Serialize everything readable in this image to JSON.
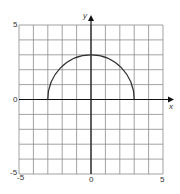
{
  "chart_data": {
    "type": "line",
    "title": "",
    "xlabel": "x",
    "ylabel": "y",
    "xlim": [
      -5,
      5
    ],
    "ylim": [
      -5,
      5
    ],
    "grid": true,
    "grid_step": 1,
    "tick_labels": {
      "x": [
        "-5",
        "0",
        "5"
      ],
      "y": [
        "-5",
        "0",
        "5"
      ]
    },
    "series": [
      {
        "name": "semicircle y = sqrt(9 - x^2)",
        "shape": "upper semicircle",
        "center": [
          0,
          0
        ],
        "radius": 3,
        "x": [
          -3,
          -2.5,
          -2,
          -1.5,
          -1,
          -0.5,
          0,
          0.5,
          1,
          1.5,
          2,
          2.5,
          3
        ],
        "y": [
          0,
          1.66,
          2.24,
          2.6,
          2.83,
          2.96,
          3,
          2.96,
          2.83,
          2.6,
          2.24,
          1.66,
          0
        ]
      }
    ],
    "legend": null
  },
  "labels": {
    "x_axis": "x",
    "y_axis": "y",
    "y_top": "5",
    "y_zero": "0",
    "y_bottom": "-5",
    "x_left": "-5",
    "x_zero": "0",
    "x_right": "5"
  },
  "colors": {
    "grid": "#8c8c8c",
    "axis": "#111111",
    "curve": "#333333"
  }
}
